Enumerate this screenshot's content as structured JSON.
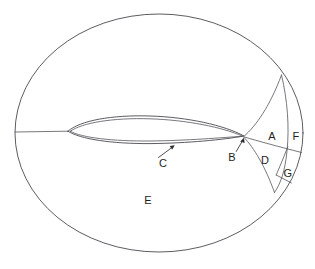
{
  "figure": {
    "type": "diagram",
    "background_color": "#ffffff",
    "line_color": "#4a4a50",
    "text_color": "#1e1e22",
    "width": 315,
    "height": 269
  },
  "labels": [
    {
      "id": "A",
      "text": "A",
      "x": 272,
      "y": 136,
      "description": "wake block adjacent to trailing edge, upper-inner"
    },
    {
      "id": "B",
      "text": "B",
      "x": 232,
      "y": 157,
      "description": "trailing edge point, annotated with leader arrow"
    },
    {
      "id": "C",
      "text": "C",
      "x": 163,
      "y": 163,
      "description": "airfoil lower surface, annotated with leader arrow"
    },
    {
      "id": "D",
      "text": "D",
      "x": 265,
      "y": 160,
      "description": "wake block adjacent to trailing edge, lower-inner"
    },
    {
      "id": "E",
      "text": "E",
      "x": 148,
      "y": 200,
      "description": "outer C-grid / far-field region"
    },
    {
      "id": "F",
      "text": "F",
      "x": 296,
      "y": 136,
      "description": "outer wake block, upper-outer"
    },
    {
      "id": "G",
      "text": "G",
      "x": 288,
      "y": 173,
      "description": "outer wake block, lower-outer"
    }
  ],
  "geometry": {
    "outer_ellipse": {
      "cx": 159,
      "cy": 133,
      "rx": 144,
      "ry": 119
    },
    "airfoil": {
      "leading_edge_x": 68,
      "leading_edge_y": 131,
      "trailing_edge_x": 244,
      "trailing_edge_y": 137
    },
    "inlet_cut_line": {
      "x1": 15,
      "y1": 132,
      "x2": 68,
      "y2": 131
    }
  },
  "leaders": [
    {
      "id": "leader-C",
      "from_x": 158,
      "from_y": 157,
      "to_x": 174,
      "to_y": 146,
      "has_arrow": true
    },
    {
      "id": "leader-B",
      "from_x": 236,
      "from_y": 151,
      "to_x": 243,
      "to_y": 139,
      "has_arrow": true
    }
  ]
}
